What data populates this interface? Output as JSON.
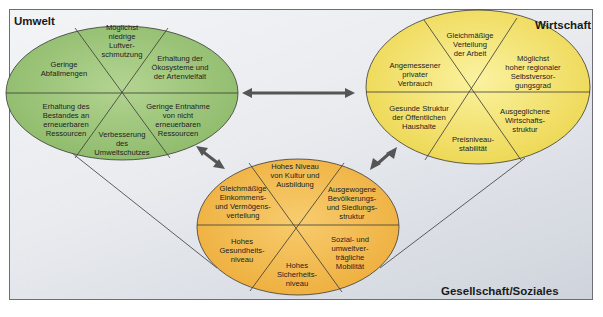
{
  "diagram": {
    "type": "sustainability-dimensions",
    "colors": {
      "umwelt_fill": "#9cc47a",
      "wirtschaft_fill": "#f4e36a",
      "gesellschaft_fill": "#f2b94a",
      "background": "#e4e7ec",
      "arrow": "#555555",
      "lines": "#3a3a3a"
    },
    "umwelt": {
      "title": "Umwelt",
      "segments": [
        "Möglichst\nniedrige\nLuftver-\nschmutzung",
        "Erhaltung der\nÖkosysteme und\nder Artenvielfalt",
        "Geringe Entnahme\nvon nicht\nerneuerbaren\nRessourcen",
        "Verbesserung\ndes\nUmweltschutzes",
        "Erhaltung des\nBestandes an\nerneuerbaren\nRessourcen",
        "Geringe\nAbfallmengen"
      ]
    },
    "wirtschaft": {
      "title": "Wirtschaft",
      "segments": [
        "Gleichmäßige\nVerteilung\nder Arbeit",
        "Möglichst\nhoher regionaler\nSelbstversor-\ngungsgrad",
        "Ausgeglichene\nWirtschafts-\nstruktur",
        "Preisniveau-\nstabilität",
        "Gesunde Struktur\nder Öffentlichen\nHaushalte",
        "Angemessener\nprivater\nVerbrauch"
      ]
    },
    "gesellschaft": {
      "title": "Gesellschaft/Soziales",
      "segments": [
        "Hohes Niveau\nvon Kultur und\nAusbildung",
        "Ausgewogene\nBevölkerungs-\nund Siedlungs-\nstruktur",
        "Sozial- und\numweltver-\nträgliche\nMobilität",
        "Hohes\nSicherheits-\nniveau",
        "Hohes\nGesundheits-\nniveau",
        "Gleichmäßige\nEinkommens-\nund Vermögens-\nverteilung"
      ]
    },
    "arrows": [
      "umwelt-wirtschaft",
      "umwelt-gesellschaft",
      "wirtschaft-gesellschaft"
    ]
  }
}
